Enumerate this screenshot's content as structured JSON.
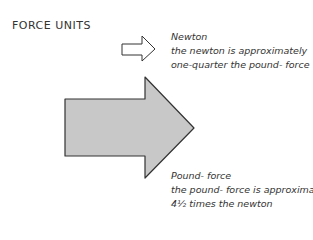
{
  "title": "FORCE UNITS",
  "colors": {
    "background": "#ffffff",
    "small_arrow_fill": "#ffffff",
    "large_arrow_fill": "#c8c8c8",
    "stroke": "#333333"
  },
  "units": [
    {
      "name": "Newton",
      "line1": "the newton is approximately",
      "line2": "one-quarter the pound- force",
      "arrow_size": "small"
    },
    {
      "name": "Pound- force",
      "line1": "the pound- force is approximately",
      "line2": "4½ times the newton",
      "arrow_size": "large"
    }
  ]
}
